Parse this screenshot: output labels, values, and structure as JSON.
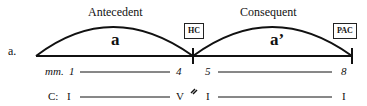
{
  "figure_label": "a.",
  "sections": [
    {
      "title": "Antecedent",
      "phrase": "a",
      "cadence": "HC"
    },
    {
      "title": "Consequent",
      "phrase": "a’",
      "cadence": "PAC"
    }
  ],
  "measures": {
    "prefix": "mm.",
    "start1": "1",
    "end1": "4",
    "start2": "5",
    "end2": "8"
  },
  "harmony": {
    "prefix": "C:",
    "ant_start": "I",
    "ant_end": "V",
    "cons_start": "I",
    "cons_end": "I",
    "caesura": "//"
  }
}
